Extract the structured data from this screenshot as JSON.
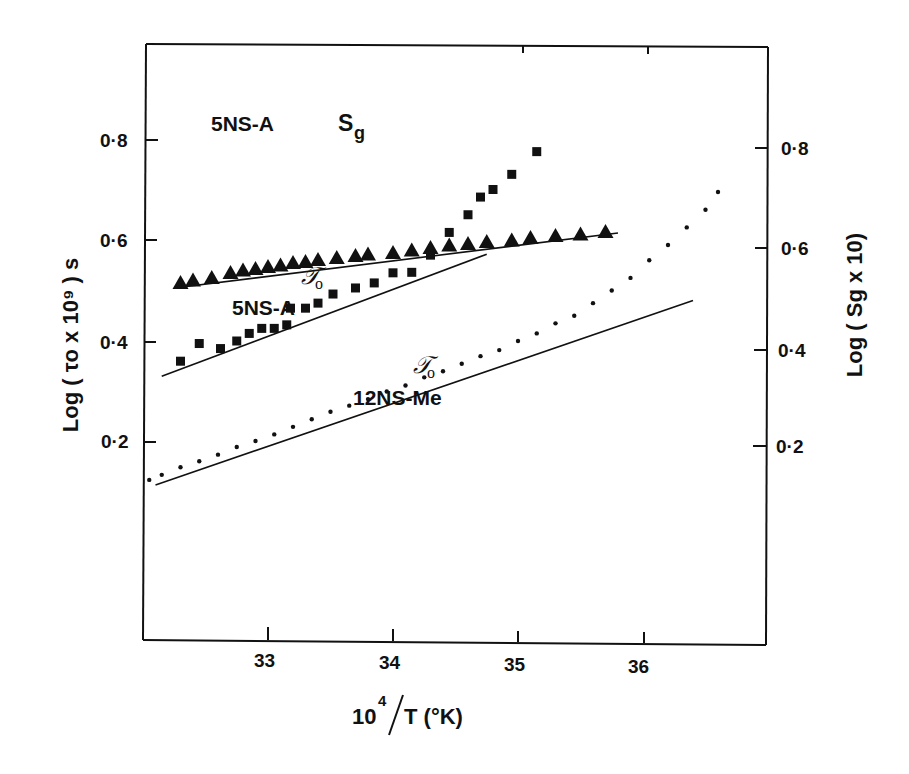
{
  "chart_data": {
    "type": "scatter",
    "title": "",
    "xlabel": "10^4/T (°K)",
    "ylabel": "Log (τo x 10^9) s",
    "ylabel_right": "Log (Sg x 10)",
    "xlim": [
      32.0,
      37.0
    ],
    "ylim": [
      0.0,
      1.0
    ],
    "ylim_right": [
      0.0,
      1.0
    ],
    "grid": false,
    "legend": "none (inline annotations)",
    "x_ticks": [
      "33",
      "34",
      "35",
      "36"
    ],
    "y_ticks_left": [
      "0·2",
      "0·4",
      "0·6",
      "0·8"
    ],
    "y_ticks_right": [
      "0·2",
      "0·4",
      "0·6",
      "0·8"
    ],
    "annotations": [
      {
        "text": "5NS-A  Sg",
        "series": "5NS-A Sg"
      },
      {
        "text": "τo 5NS-A",
        "series": "5NS-A τo"
      },
      {
        "text": "τo 12NS-Me",
        "series": "12NS-Me τo"
      }
    ],
    "series": [
      {
        "name": "5NS-A Sg",
        "marker": "triangle",
        "axis": "right",
        "x": [
          32.3,
          32.4,
          32.55,
          32.7,
          32.8,
          32.9,
          33.0,
          33.1,
          33.2,
          33.3,
          33.4,
          33.55,
          33.7,
          33.8,
          34.0,
          34.15,
          34.3,
          34.45,
          34.6,
          34.75,
          34.95,
          35.1,
          35.3,
          35.5,
          35.7
        ],
        "y": [
          0.73,
          0.735,
          0.74,
          0.75,
          0.755,
          0.758,
          0.762,
          0.765,
          0.77,
          0.772,
          0.776,
          0.78,
          0.784,
          0.787,
          0.79,
          0.795,
          0.8,
          0.805,
          0.808,
          0.812,
          0.815,
          0.82,
          0.824,
          0.827,
          0.832
        ]
      },
      {
        "name": "5NS-A τo",
        "marker": "square",
        "axis": "left",
        "x": [
          32.3,
          32.45,
          32.62,
          32.75,
          32.85,
          32.95,
          33.05,
          33.15,
          33.18,
          33.3,
          33.4,
          33.52,
          33.7,
          33.85,
          34.0,
          34.15,
          34.3,
          34.45,
          34.6,
          34.7,
          34.8,
          34.95,
          35.15
        ],
        "y": [
          0.56,
          0.595,
          0.585,
          0.6,
          0.615,
          0.625,
          0.625,
          0.632,
          0.665,
          0.665,
          0.675,
          0.693,
          0.705,
          0.715,
          0.735,
          0.736,
          0.77,
          0.815,
          0.85,
          0.885,
          0.9,
          0.93,
          0.975
        ]
      },
      {
        "name": "12NS-Me τo",
        "marker": "dot",
        "axis": "left",
        "x": [
          32.05,
          32.15,
          32.3,
          32.45,
          32.6,
          32.75,
          32.9,
          33.05,
          33.2,
          33.35,
          33.5,
          33.65,
          33.8,
          33.95,
          34.1,
          34.25,
          34.4,
          34.55,
          34.7,
          34.85,
          35.0,
          35.15,
          35.3,
          35.45,
          35.6,
          35.75,
          35.9,
          36.05,
          36.2,
          36.35,
          36.5,
          36.6
        ],
        "y": [
          0.325,
          0.335,
          0.35,
          0.362,
          0.375,
          0.39,
          0.402,
          0.415,
          0.43,
          0.445,
          0.46,
          0.472,
          0.485,
          0.5,
          0.512,
          0.528,
          0.54,
          0.555,
          0.57,
          0.582,
          0.6,
          0.615,
          0.635,
          0.65,
          0.675,
          0.7,
          0.725,
          0.76,
          0.79,
          0.825,
          0.86,
          0.895
        ]
      }
    ],
    "fit_lines": [
      {
        "name": "5NS-A Sg fit",
        "x": [
          32.25,
          35.8
        ],
        "y": [
          0.72,
          0.83
        ],
        "axis": "right"
      },
      {
        "name": "5NS-A τo fit",
        "x": [
          32.15,
          34.75
        ],
        "y": [
          0.53,
          0.772
        ],
        "axis": "left"
      },
      {
        "name": "12NS-Me τo fit",
        "x": [
          32.1,
          36.4
        ],
        "y": [
          0.315,
          0.68
        ],
        "axis": "left"
      }
    ]
  },
  "labels": {
    "x_axis_title_main": "10",
    "x_axis_title_sup": "4",
    "x_axis_title_rest": "T (°K)",
    "y_left_title": "Log ( τ",
    "y_left_title_full": "Log ( τo x 10⁹ ) s",
    "y_right_title": "Log ( Sg x 10)",
    "annot_sg_series": "5NS-A",
    "annot_sg_symbol": "S",
    "annot_sg_sub": "g",
    "annot_tau_symbol": "𝒯",
    "annot_tau_sub": "o",
    "annot_5nsa": "5NS-A",
    "annot_12nsme": "12NS-Me"
  }
}
